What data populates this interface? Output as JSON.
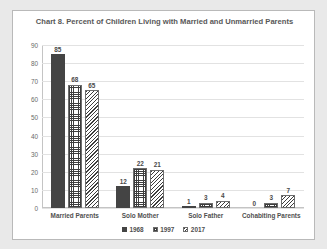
{
  "chart_data": {
    "type": "bar",
    "title": "Chart 8. Percent of Children Living with Married and Unmarried Parents",
    "xlabel": "",
    "ylabel": "",
    "ylim": [
      0,
      90
    ],
    "yticks": [
      90,
      80,
      70,
      60,
      50,
      40,
      30,
      20,
      10,
      0
    ],
    "grid": true,
    "legend_position": "bottom",
    "categories": [
      "Married Parents",
      "Solo Mother",
      "Solo Father",
      "Cohabiting Parents"
    ],
    "series": [
      {
        "name": "1968",
        "values": [
          85,
          12,
          1,
          0
        ],
        "fill": "solid",
        "color": "#444444"
      },
      {
        "name": "1997",
        "values": [
          68,
          22,
          3,
          3
        ],
        "fill": "grid-hatch",
        "color": "#3d3d3d"
      },
      {
        "name": "2017",
        "values": [
          65,
          21,
          4,
          7
        ],
        "fill": "diagonal-hatch",
        "color": "#3d3d3d"
      }
    ]
  },
  "colors": {
    "page_background": "#e9e9e9",
    "card_background": "#ffffff",
    "card_border": "#b9b9b9",
    "gridline": "#e2e2e2",
    "axis": "#c4c4c4",
    "title_text": "#585858",
    "label_text": "#4f4f4f",
    "tick_text": "#6a6a6a"
  }
}
